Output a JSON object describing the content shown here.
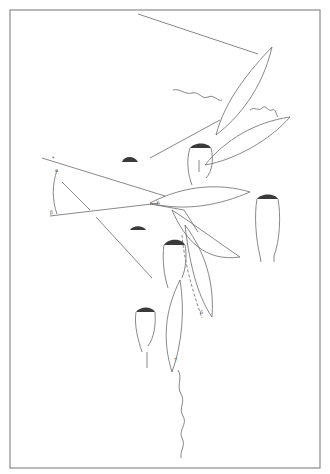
{
  "figure": {
    "type": "line-drawing",
    "frame": {
      "x": 10,
      "y": 10,
      "width": 310,
      "height": 458,
      "stroke": "#8a8a8a"
    },
    "stroke_color": "#6a6a6a",
    "labels": {
      "top_left_mark": "*",
      "angle_vertex_top": "α",
      "angle_vertex_bottom": "β",
      "angle_mid": "γ",
      "leaf_tip_1": "6",
      "leaf_tip_2": "7"
    }
  }
}
